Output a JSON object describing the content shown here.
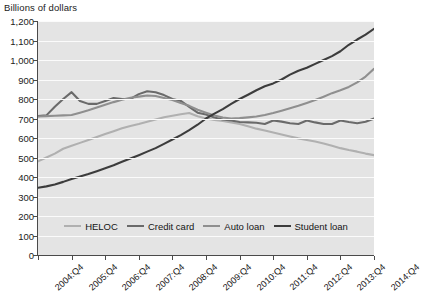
{
  "chart_data": {
    "type": "line",
    "title": "Billions of dollars",
    "xlabel": "",
    "ylabel": "Billions of dollars",
    "ylim": [
      0,
      1200
    ],
    "ytick_step": 100,
    "grid": true,
    "legend_position": "inside-bottom-center",
    "ytick_labels": [
      "1,200",
      "1,100",
      "1,000",
      "900",
      "800",
      "700",
      "600",
      "500",
      "400",
      "300",
      "200",
      "100",
      "0"
    ],
    "xtick_labels": [
      "2004:Q4",
      "2005:Q4",
      "2006:Q4",
      "2007:Q4",
      "2008:Q4",
      "2009:Q4",
      "2010:Q4",
      "2011:Q4",
      "2012:Q4",
      "2013:Q4",
      "2014:Q4"
    ],
    "x": [
      "2004:Q4",
      "2005:Q1",
      "2005:Q2",
      "2005:Q3",
      "2005:Q4",
      "2006:Q1",
      "2006:Q2",
      "2006:Q3",
      "2006:Q4",
      "2007:Q1",
      "2007:Q2",
      "2007:Q3",
      "2007:Q4",
      "2008:Q1",
      "2008:Q2",
      "2008:Q3",
      "2008:Q4",
      "2009:Q1",
      "2009:Q2",
      "2009:Q3",
      "2009:Q4",
      "2010:Q1",
      "2010:Q2",
      "2010:Q3",
      "2010:Q4",
      "2011:Q1",
      "2011:Q2",
      "2011:Q3",
      "2011:Q4",
      "2012:Q1",
      "2012:Q2",
      "2012:Q3",
      "2012:Q4",
      "2013:Q1",
      "2013:Q2",
      "2013:Q3",
      "2013:Q4",
      "2014:Q1",
      "2014:Q2",
      "2014:Q3",
      "2014:Q4"
    ],
    "series": [
      {
        "name": "HELOC",
        "color": "#b0b0b0",
        "values": [
          480,
          500,
          520,
          545,
          560,
          575,
          590,
          605,
          620,
          635,
          650,
          662,
          672,
          683,
          695,
          706,
          714,
          722,
          728,
          712,
          700,
          693,
          687,
          680,
          672,
          660,
          648,
          638,
          628,
          618,
          608,
          598,
          590,
          582,
          572,
          560,
          548,
          538,
          530,
          520,
          512
        ]
      },
      {
        "name": "Credit card",
        "color": "#6a6a6a",
        "values": [
          712,
          716,
          760,
          800,
          835,
          790,
          775,
          775,
          790,
          805,
          800,
          800,
          825,
          840,
          835,
          820,
          800,
          790,
          760,
          730,
          720,
          705,
          695,
          690,
          682,
          680,
          678,
          672,
          690,
          684,
          676,
          672,
          690,
          680,
          672,
          672,
          690,
          682,
          676,
          683,
          700
        ]
      },
      {
        "name": "Auto loan",
        "color": "#8f8f8f",
        "values": [
          710,
          712,
          714,
          716,
          718,
          730,
          742,
          756,
          770,
          784,
          796,
          806,
          812,
          818,
          815,
          805,
          795,
          780,
          765,
          745,
          730,
          715,
          705,
          700,
          702,
          706,
          710,
          718,
          728,
          740,
          752,
          765,
          780,
          795,
          812,
          830,
          845,
          862,
          885,
          915,
          955
        ]
      },
      {
        "name": "Student loan",
        "color": "#3c3c3c",
        "values": [
          345,
          352,
          362,
          375,
          390,
          402,
          415,
          430,
          445,
          460,
          478,
          495,
          512,
          530,
          548,
          570,
          592,
          615,
          640,
          668,
          700,
          725,
          748,
          775,
          800,
          822,
          845,
          865,
          880,
          900,
          925,
          945,
          960,
          980,
          1000,
          1020,
          1045,
          1078,
          1105,
          1130,
          1160
        ]
      }
    ]
  },
  "legend": {
    "items": [
      {
        "label": "HELOC"
      },
      {
        "label": "Credit card"
      },
      {
        "label": "Auto loan"
      },
      {
        "label": "Student loan"
      }
    ]
  }
}
